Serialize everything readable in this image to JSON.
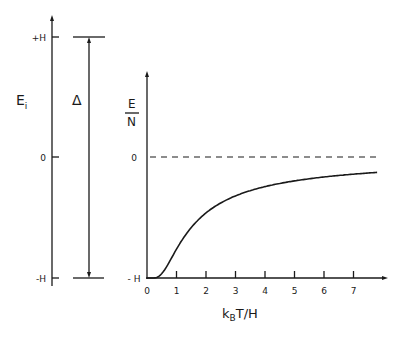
{
  "chart_data": [
    {
      "type": "diagram",
      "name": "energy-levels",
      "ylabel": "E",
      "ylabel_sub": "i",
      "tick_labels": [
        "+H",
        "0",
        "-H"
      ],
      "levels": [
        1,
        -1
      ],
      "gap_label": "Δ"
    },
    {
      "type": "line",
      "title": "",
      "ylabel_num": "E",
      "ylabel_den": "N",
      "xlabel_main": "k",
      "xlabel_sub": "B",
      "xlabel_rest": "T/H",
      "xlim": [
        0,
        8
      ],
      "ylim": [
        -1,
        0.6
      ],
      "x_ticks": [
        0,
        1,
        2,
        3,
        4,
        5,
        6,
        7
      ],
      "x_tick_labels": [
        "0",
        "1",
        "2",
        "3",
        "4",
        "5",
        "6",
        "7"
      ],
      "y_ticks": [
        0,
        -1
      ],
      "y_tick_labels": [
        "0",
        "- H"
      ],
      "reference_line": {
        "y": 0,
        "style": "dashed"
      },
      "series": [
        {
          "name": "E/N = -H tanh(H/k_B T)",
          "x": [
            0,
            0.2,
            0.4,
            0.6,
            0.8,
            1.0,
            1.25,
            1.5,
            2.0,
            2.5,
            3.0,
            3.5,
            4.0,
            4.5,
            5.0,
            5.5,
            6.0,
            6.5,
            7.0,
            7.5,
            7.8
          ],
          "y": [
            -1,
            -1,
            -0.9993,
            -0.9866,
            -0.9488,
            -0.7616,
            -0.664,
            -0.5828,
            -0.4621,
            -0.3799,
            -0.3215,
            -0.2783,
            -0.2449,
            -0.2186,
            -0.1974,
            -0.1799,
            -0.1651,
            -0.1527,
            -0.1419,
            -0.1326,
            -0.1276
          ]
        }
      ]
    }
  ]
}
